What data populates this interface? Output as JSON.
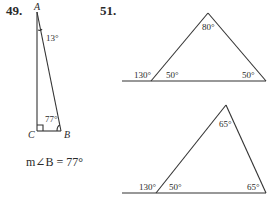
{
  "problems": [
    {
      "number": "49.",
      "figure": "right-triangle",
      "vertices": {
        "A": "A",
        "B": "B",
        "C": "C"
      },
      "angle_labels": {
        "A": "13°",
        "B": "77°"
      },
      "right_angle_at": "C",
      "answer": "m∠B = 77°"
    },
    {
      "number": "51.",
      "figures": [
        {
          "apex_angle": "80°",
          "exterior_angle": "130°",
          "base_left_angle": "50°",
          "base_right_angle": "50°"
        },
        {
          "apex_angle": "65°",
          "exterior_angle": "130°",
          "base_left_angle": "50°",
          "base_right_angle": "65°"
        }
      ]
    }
  ]
}
